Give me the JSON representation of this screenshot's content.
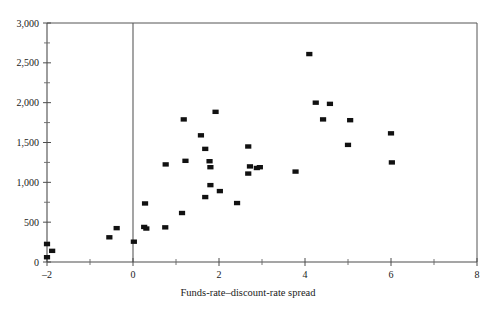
{
  "chart_data": {
    "type": "scatter",
    "title": "",
    "subtitle": "",
    "xlabel": "Funds-rate–discount-rate spread",
    "ylabel": "",
    "xlim": [
      -2,
      8
    ],
    "ylim": [
      0,
      3000
    ],
    "grid": false,
    "legend": null,
    "x_ticks": [
      -2,
      0,
      2,
      4,
      6,
      8
    ],
    "x_tick_labels": [
      "–2",
      "0",
      "2",
      "4",
      "6",
      "8"
    ],
    "x_minor_ticks": [
      -1,
      1,
      3,
      5,
      7
    ],
    "y_ticks": [
      0,
      500,
      1000,
      1500,
      2000,
      2500,
      3000
    ],
    "y_tick_labels": [
      "0",
      "500",
      "1,000",
      "1,500",
      "2,000",
      "2,500",
      "3,000"
    ],
    "y_minor_ticks": [
      250,
      750,
      1250,
      1750,
      2250,
      2750
    ],
    "marker": "square",
    "marker_color": "#111111",
    "points": [
      {
        "x": -2.0,
        "y": 225
      },
      {
        "x": -2.0,
        "y": 60
      },
      {
        "x": -1.88,
        "y": 140
      },
      {
        "x": -0.55,
        "y": 310
      },
      {
        "x": -0.38,
        "y": 425
      },
      {
        "x": 0.02,
        "y": 255
      },
      {
        "x": 0.28,
        "y": 735
      },
      {
        "x": 0.26,
        "y": 440
      },
      {
        "x": 0.31,
        "y": 420
      },
      {
        "x": 0.75,
        "y": 435
      },
      {
        "x": 0.76,
        "y": 1225
      },
      {
        "x": 1.14,
        "y": 615
      },
      {
        "x": 1.18,
        "y": 1790
      },
      {
        "x": 1.22,
        "y": 1270
      },
      {
        "x": 1.58,
        "y": 1590
      },
      {
        "x": 1.68,
        "y": 815
      },
      {
        "x": 1.68,
        "y": 1420
      },
      {
        "x": 1.78,
        "y": 1265
      },
      {
        "x": 1.8,
        "y": 1190
      },
      {
        "x": 1.8,
        "y": 965
      },
      {
        "x": 1.92,
        "y": 1885
      },
      {
        "x": 2.02,
        "y": 890
      },
      {
        "x": 2.42,
        "y": 740
      },
      {
        "x": 2.68,
        "y": 1450
      },
      {
        "x": 2.68,
        "y": 1110
      },
      {
        "x": 2.72,
        "y": 1200
      },
      {
        "x": 2.88,
        "y": 1180
      },
      {
        "x": 2.95,
        "y": 1190
      },
      {
        "x": 3.78,
        "y": 1135
      },
      {
        "x": 4.1,
        "y": 2610
      },
      {
        "x": 4.25,
        "y": 2000
      },
      {
        "x": 4.42,
        "y": 1790
      },
      {
        "x": 4.58,
        "y": 1985
      },
      {
        "x": 5.0,
        "y": 1470
      },
      {
        "x": 5.05,
        "y": 1780
      },
      {
        "x": 6.0,
        "y": 1615
      },
      {
        "x": 6.02,
        "y": 1250
      }
    ]
  }
}
